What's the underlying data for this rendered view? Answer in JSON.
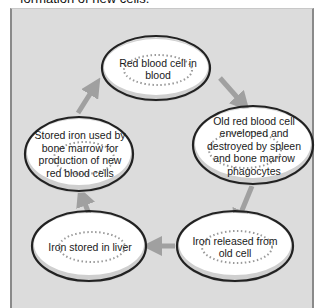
{
  "caption": "formation of new cells.",
  "colors": {
    "panel_background": "#dcdcdc",
    "ellipse_fill": "#ffffff",
    "ellipse_shadow": "#cfcfcf",
    "ellipse_outline": "#222222",
    "dots": "#9a9a9a",
    "arrow": "#a0a0a0"
  },
  "nodes": [
    {
      "id": "rbc-in-blood",
      "label": "Red blood cell in blood"
    },
    {
      "id": "old-rbc-destroyed",
      "label": "Old red blood cell enveloped and destroyed by spleen and bone marrow phagocytes"
    },
    {
      "id": "iron-released",
      "label": "Iron released from old cell"
    },
    {
      "id": "iron-stored-liver",
      "label": "Iron stored in liver"
    },
    {
      "id": "stored-iron-used",
      "label": "Stored iron used by bone marrow for production of new red blood cells"
    }
  ],
  "edges": [
    {
      "from": "rbc-in-blood",
      "to": "old-rbc-destroyed"
    },
    {
      "from": "old-rbc-destroyed",
      "to": "iron-released"
    },
    {
      "from": "iron-released",
      "to": "iron-stored-liver"
    },
    {
      "from": "iron-stored-liver",
      "to": "stored-iron-used"
    },
    {
      "from": "stored-iron-used",
      "to": "rbc-in-blood"
    }
  ]
}
